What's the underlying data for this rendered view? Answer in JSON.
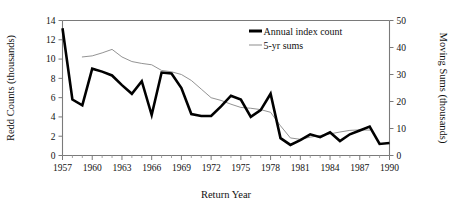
{
  "chart_data": {
    "type": "line",
    "title": "",
    "xlabel": "Return Year",
    "ylabel": "Redd Counts (thousands)",
    "y2label": "Moving Sums (thousands)",
    "grid": false,
    "legend_position": "top-right",
    "xlim": [
      1957,
      1990
    ],
    "ylim": [
      0,
      14
    ],
    "y2lim": [
      0,
      50
    ],
    "x": [
      1957,
      1958,
      1959,
      1960,
      1961,
      1962,
      1963,
      1964,
      1965,
      1966,
      1967,
      1968,
      1969,
      1970,
      1971,
      1972,
      1973,
      1974,
      1975,
      1976,
      1977,
      1978,
      1979,
      1980,
      1981,
      1982,
      1983,
      1984,
      1985,
      1986,
      1987,
      1988,
      1989,
      1990
    ],
    "xtick_labels": [
      "1957",
      "1960",
      "1963",
      "1966",
      "1969",
      "1972",
      "1975",
      "1978",
      "1981",
      "1984",
      "1987",
      "1990"
    ],
    "xtick_values": [
      1957,
      1960,
      1963,
      1966,
      1969,
      1972,
      1975,
      1978,
      1981,
      1984,
      1987,
      1990
    ],
    "ytick_labels": [
      "0",
      "2",
      "4",
      "6",
      "8",
      "10",
      "12",
      "14"
    ],
    "ytick_values": [
      0,
      2,
      4,
      6,
      8,
      10,
      12,
      14
    ],
    "y2tick_labels": [
      "0",
      "10",
      "20",
      "30",
      "40",
      "50"
    ],
    "y2tick_values": [
      0,
      10,
      20,
      30,
      40,
      50
    ],
    "series": [
      {
        "name": "Annual index count",
        "axis": "left",
        "style": "thick-black",
        "color": "#000000",
        "x": [
          1957,
          1958,
          1959,
          1960,
          1961,
          1962,
          1963,
          1964,
          1965,
          1966,
          1967,
          1968,
          1969,
          1970,
          1971,
          1972,
          1973,
          1974,
          1975,
          1976,
          1977,
          1978,
          1979,
          1980,
          1981,
          1982,
          1983,
          1984,
          1985,
          1986,
          1987,
          1988,
          1989,
          1990
        ],
        "values": [
          13.2,
          5.8,
          5.2,
          9.0,
          8.7,
          8.3,
          7.3,
          6.4,
          7.7,
          4.2,
          8.6,
          8.5,
          7.0,
          4.3,
          4.1,
          4.1,
          5.1,
          6.2,
          5.8,
          4.0,
          4.7,
          6.4,
          1.8,
          1.1,
          1.6,
          2.2,
          1.9,
          2.4,
          1.5,
          2.2,
          2.6,
          3.0,
          1.2,
          1.3
        ]
      },
      {
        "name": "5-yr sums",
        "axis": "right",
        "style": "thin-gray",
        "color": "#8d8d8d",
        "x": [
          1959,
          1960,
          1961,
          1962,
          1963,
          1964,
          1965,
          1966,
          1967,
          1968,
          1969,
          1970,
          1971,
          1972,
          1973,
          1974,
          1975,
          1976,
          1977,
          1978,
          1979,
          1980,
          1981,
          1982,
          1983,
          1984,
          1985,
          1986,
          1987,
          1988
        ],
        "values": [
          36.5,
          36.9,
          38.0,
          39.3,
          36.5,
          34.8,
          34.1,
          33.6,
          31.5,
          31.0,
          30.0,
          27.8,
          24.6,
          21.4,
          20.4,
          19.0,
          17.8,
          17.5,
          17.0,
          16.0,
          11.0,
          6.5,
          6.0,
          6.8,
          7.4,
          8.0,
          8.7,
          9.3,
          9.5,
          9.4
        ]
      }
    ]
  },
  "legend": {
    "items": [
      {
        "label": "Annual index count"
      },
      {
        "label": "5-yr sums"
      }
    ]
  }
}
